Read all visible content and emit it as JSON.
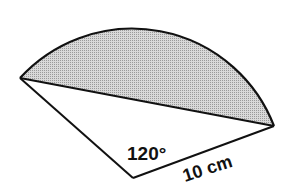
{
  "figure": {
    "type": "circle-sector-with-shaded-segment",
    "angle_label": "120°",
    "radius_label": "10 cm",
    "angle_degrees": 120,
    "radius_cm": 10,
    "shaded_region": "minor segment between chord and arc",
    "colors": {
      "stroke": "#111111",
      "shading": "#c8c8c8",
      "background": "#ffffff"
    }
  }
}
